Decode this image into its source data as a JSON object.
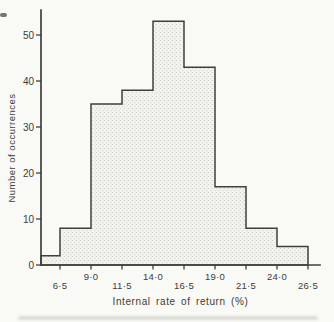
{
  "figure": {
    "paper_color": "#f9f9f6",
    "ink_color": "#413f3a",
    "text_color": "#3d3c38",
    "bar_fill_base": "#f4f4f1",
    "bar_dot_color": "#cfcfc8",
    "bar_dot_color_2": "#dcdcd6"
  },
  "chart_data": {
    "type": "bar",
    "subtype": "histogram",
    "xlabel": "Internal rate of return (%)",
    "ylabel": "Number of occurrences",
    "categories": [
      "<6·5",
      "6·5–9·0",
      "9·0–11·5",
      "11·5–14·0",
      "14·0–16·5",
      "16·5–19·0",
      "19·0–21·5",
      "21·5–24·0",
      "24·0–26·5"
    ],
    "values": [
      2,
      8,
      35,
      38,
      53,
      43,
      17,
      8,
      4
    ],
    "bin_width": 2.5,
    "x_tick_values": [
      6.5,
      9.0,
      11.5,
      14.0,
      16.5,
      19.0,
      21.5,
      24.0,
      26.5
    ],
    "x_tick_labels": [
      "6·5",
      "9·0",
      "11·5",
      "14·0",
      "16·5",
      "19·0",
      "21·5",
      "24·0",
      "26·5"
    ],
    "x_tick_row": [
      "low",
      "high",
      "low",
      "high",
      "low",
      "high",
      "low",
      "high",
      "low"
    ],
    "y_ticks": [
      0,
      10,
      20,
      30,
      40,
      50
    ],
    "y_tick_labels": [
      "0",
      "10",
      "20",
      "30",
      "40",
      "50"
    ],
    "ylim": [
      0,
      55
    ],
    "grid": "off",
    "legend": "none",
    "bar_style": "stippled halftone fill with dark stepped outline; first bar starts at y-axis"
  }
}
